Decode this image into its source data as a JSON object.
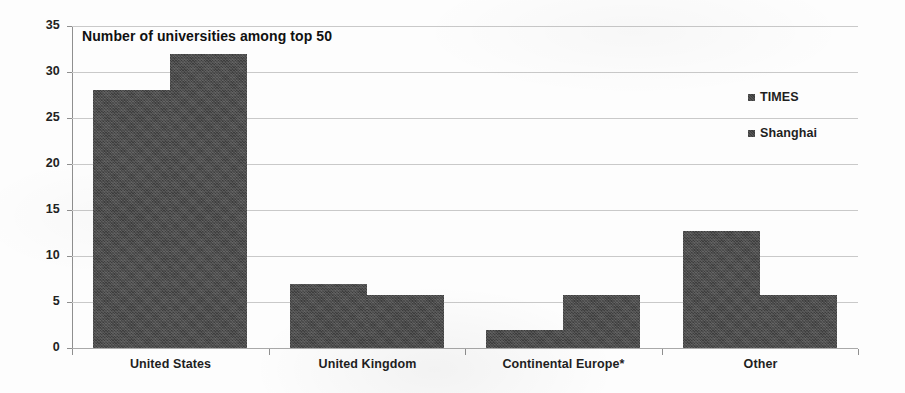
{
  "chart_data": {
    "type": "bar",
    "title": "Number of universities among top 50",
    "xlabel": "",
    "ylabel": "",
    "ylim": [
      0,
      35
    ],
    "ytick_step": 5,
    "yticks": [
      35,
      30,
      25,
      20,
      15,
      10,
      5,
      0
    ],
    "grid": true,
    "legend_position": "right",
    "categories": [
      "United States",
      "United Kingdom",
      "Continental Europe*",
      "Other"
    ],
    "series": [
      {
        "name": "TIMES",
        "color": "#3d3d3d",
        "values": [
          28,
          7,
          2,
          12.7
        ]
      },
      {
        "name": "Shanghai",
        "color": "#3d3d3d",
        "values": [
          32,
          5.8,
          5.8,
          5.8
        ]
      }
    ]
  },
  "legend": {
    "items": [
      {
        "label": "TIMES",
        "swatch": "legend-swatch-icon"
      },
      {
        "label": "Shanghai",
        "swatch": "legend-swatch-icon"
      }
    ]
  },
  "axis": {
    "y_labels": [
      "35",
      "30",
      "25",
      "20",
      "15",
      "10",
      "5",
      "0"
    ],
    "x_labels": [
      "United States",
      "United Kingdom",
      "Continental Europe*",
      "Other"
    ]
  }
}
